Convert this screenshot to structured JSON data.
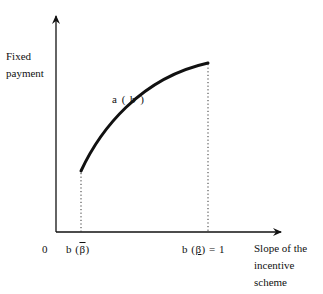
{
  "diagram": {
    "y_axis_label_line1": "Fixed",
    "y_axis_label_line2": "payment",
    "x_axis_label_line1": "Slope of the",
    "x_axis_label_line2": "incentive",
    "x_axis_label_line3": "scheme",
    "origin_label": "0",
    "curve_label": "a ( b )",
    "tick_left": {
      "prefix": "b (",
      "symbol": "β",
      "suffix": ")",
      "decoration": "bar"
    },
    "tick_right": {
      "prefix": "b (",
      "symbol": "β",
      "suffix": ") = 1",
      "decoration": "underline"
    },
    "curve": {
      "type": "concave increasing",
      "start": [
        81,
        171
      ],
      "end": [
        208,
        63
      ]
    },
    "colors": {
      "ink": "#111111",
      "background": "#ffffff"
    }
  }
}
